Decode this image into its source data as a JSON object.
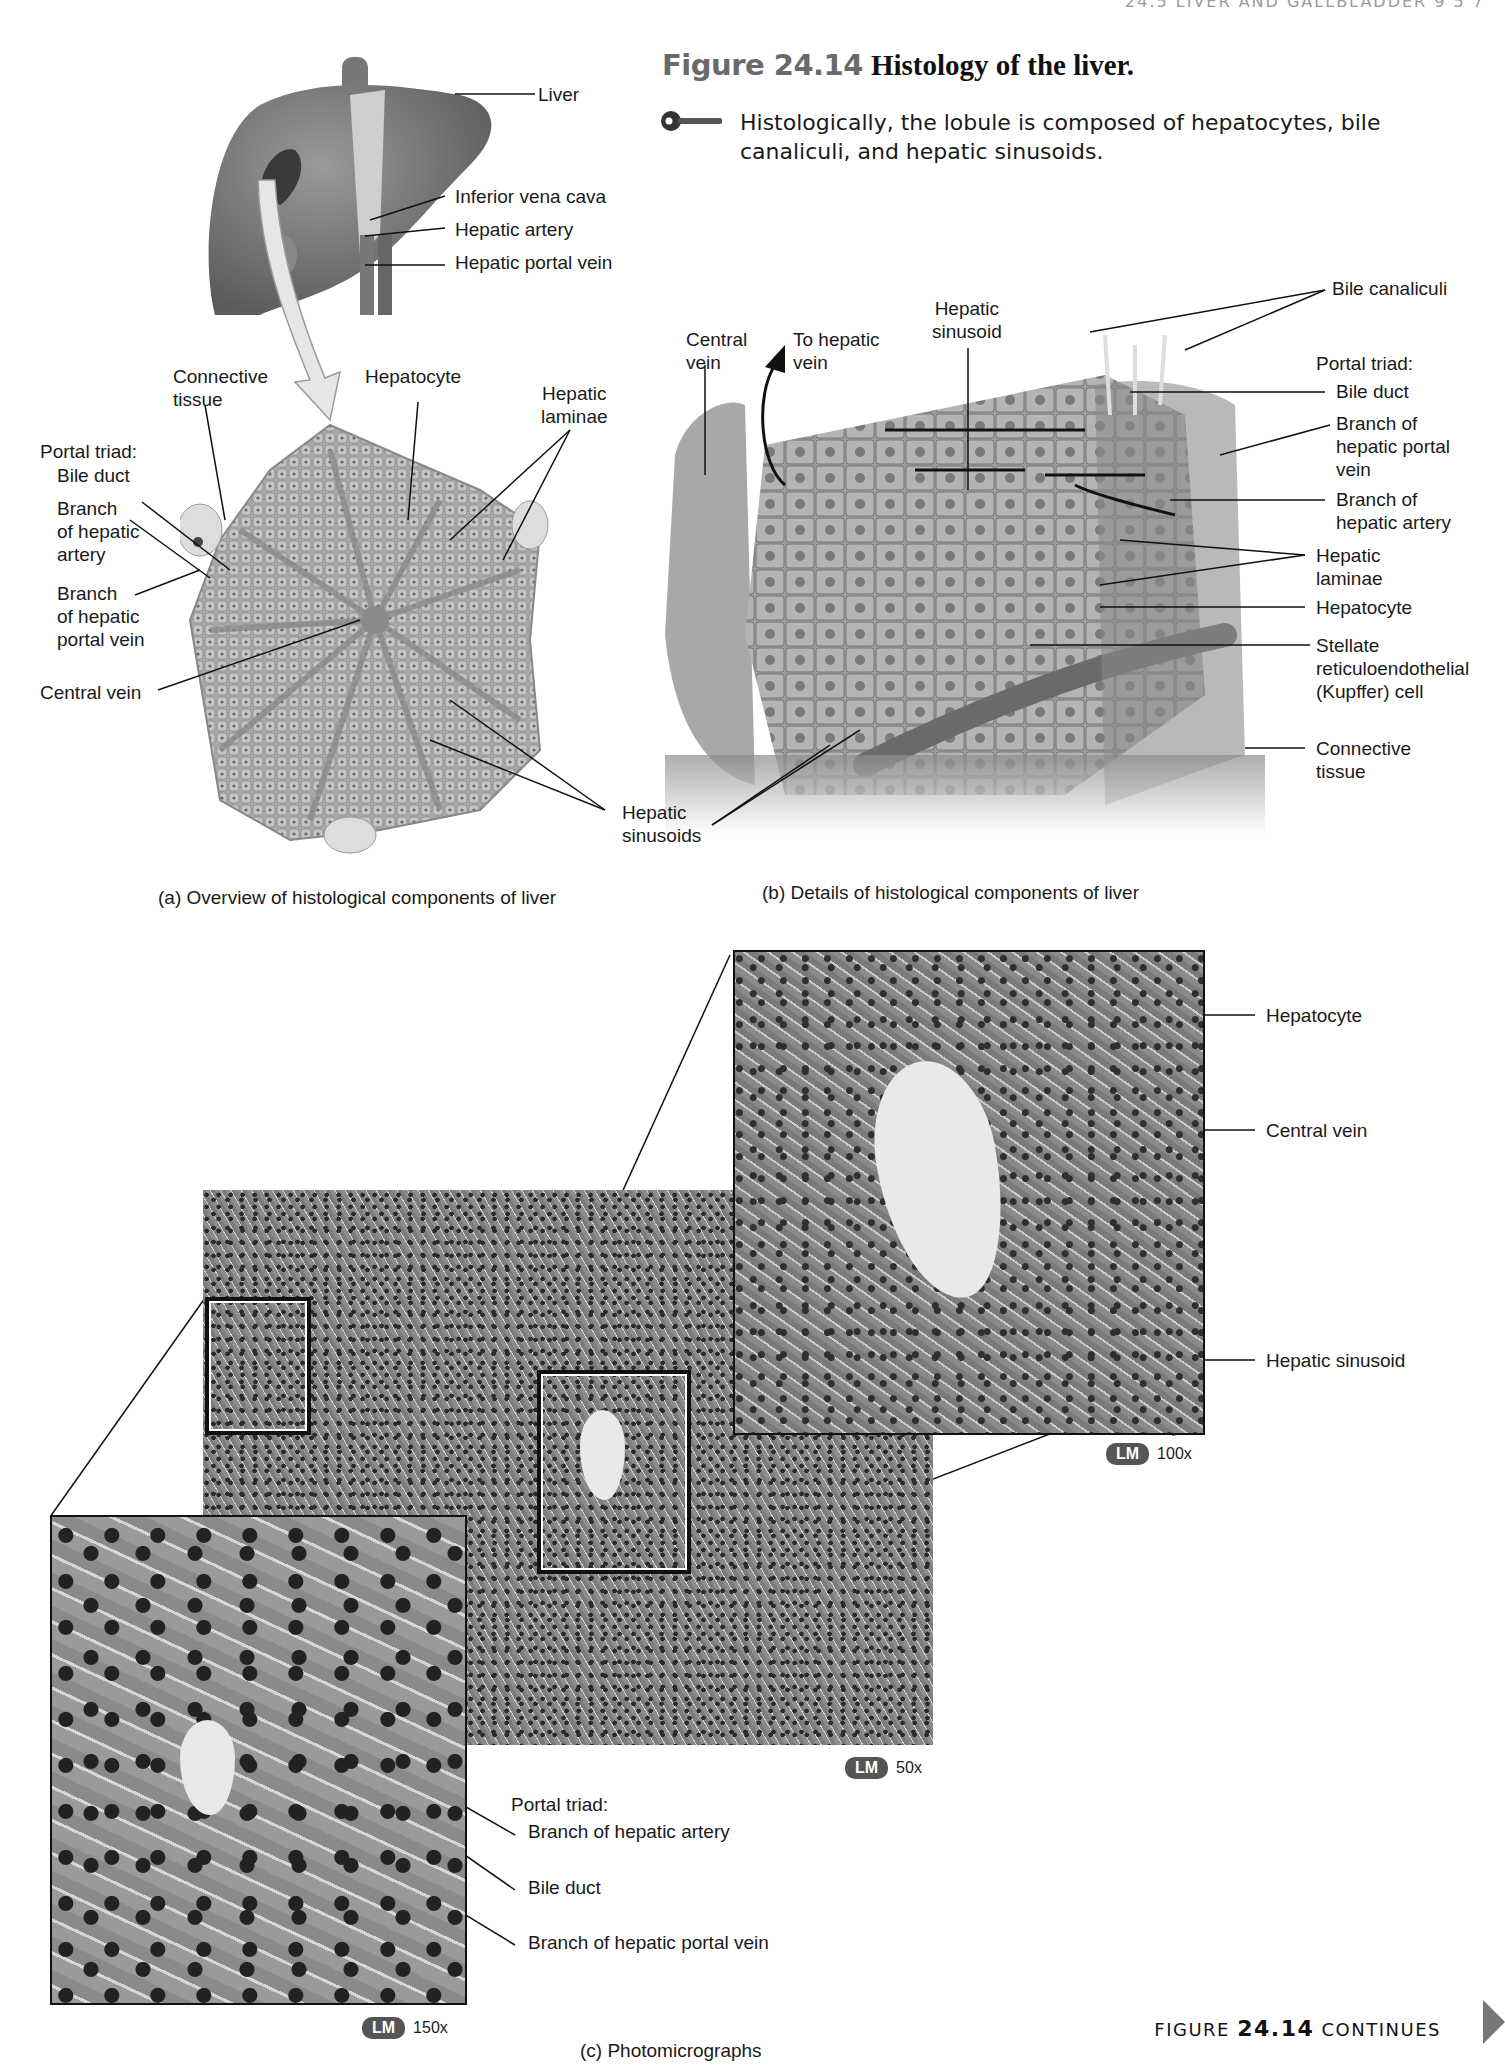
{
  "running_head": "24.5 LIVER AND GALLBLADDER 9 5 7",
  "figure": {
    "number": "Figure 24.14",
    "title": "Histology of the liver.",
    "key_caption": "Histologically, the lobule is composed of hepatocytes, bile canaliculi, and hepatic sinusoids.",
    "key_icon": "key-icon"
  },
  "panel_a": {
    "caption": "(a) Overview of histological components of liver",
    "labels": {
      "liver": "Liver",
      "ivc": "Inferior vena cava",
      "hepatic_artery": "Hepatic artery",
      "hepatic_portal_vein": "Hepatic portal vein",
      "connective_tissue": "Connective\ntissue",
      "hepatocyte": "Hepatocyte",
      "hepatic_laminae": "Hepatic\nlaminae",
      "portal_triad": "Portal triad:",
      "bile_duct": "Bile duct",
      "branch_hepatic_artery": "Branch\nof hepatic\nartery",
      "branch_hepatic_portal_vein": "Branch\nof hepatic\nportal vein",
      "central_vein": "Central vein",
      "hepatic_sinusoids": "Hepatic\nsinusoids"
    }
  },
  "panel_b": {
    "caption": "(b) Details of histological components of liver",
    "labels": {
      "central_vein": "Central\nvein",
      "to_hepatic_vein": "To hepatic\nvein",
      "hepatic_sinusoid": "Hepatic\nsinusoid",
      "bile_canaliculi": "Bile canaliculi",
      "portal_triad": "Portal triad:",
      "bile_duct": "Bile duct",
      "branch_hepatic_portal_vein": "Branch of\nhepatic portal\nvein",
      "branch_hepatic_artery": "Branch of\nhepatic artery",
      "hepatic_laminae": "Hepatic\nlaminae",
      "hepatocyte": "Hepatocyte",
      "kupffer": "Stellate\nreticuloendothelial\n(Kupffer) cell",
      "connective_tissue": "Connective\ntissue"
    }
  },
  "panel_c": {
    "caption": "(c) Photomicrographs",
    "micrographs": [
      {
        "id": "50x",
        "badge": "LM",
        "magnification": "50x"
      },
      {
        "id": "100x",
        "badge": "LM",
        "magnification": "100x",
        "labels": {
          "hepatocyte": "Hepatocyte",
          "central_vein": "Central vein",
          "hepatic_sinusoid": "Hepatic sinusoid"
        }
      },
      {
        "id": "150x",
        "badge": "LM",
        "magnification": "150x",
        "labels": {
          "portal_triad": "Portal triad:",
          "branch_hepatic_artery": "Branch of hepatic artery",
          "bile_duct": "Bile duct",
          "branch_hepatic_portal_vein": "Branch of hepatic portal vein"
        }
      }
    ]
  },
  "footer": {
    "continues_prefix": "FIGURE",
    "continues_number": "24.14",
    "continues_suffix": "CONTINUES",
    "next_icon": "next-page-arrow-icon"
  }
}
